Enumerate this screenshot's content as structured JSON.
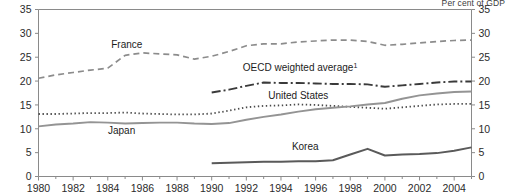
{
  "unit_note": "Per cent of GDP",
  "chart_data": {
    "type": "line",
    "title": "",
    "subtitle": "",
    "xlabel": "",
    "ylabel": "Per cent of GDP",
    "xlim": [
      1980,
      2005
    ],
    "ylim": [
      0,
      35
    ],
    "grid": false,
    "legend_position": "inline-annotations",
    "xticks": [
      1980,
      1982,
      1984,
      1986,
      1988,
      1990,
      1992,
      1994,
      1996,
      1998,
      2000,
      2002,
      2004
    ],
    "xtick_labels": [
      "1980",
      "1982",
      "1984",
      "1986",
      "1988",
      "1990",
      "1992",
      "1994",
      "1996",
      "1998",
      "2000",
      "2002",
      "2004"
    ],
    "yticks": [
      0,
      5,
      10,
      15,
      20,
      25,
      30,
      35
    ],
    "ytick_labels_left": [
      "0",
      "5",
      "10",
      "15",
      "20",
      "25",
      "30",
      "35"
    ],
    "ytick_labels_right": [
      "0",
      "5",
      "10",
      "15",
      "20",
      "25",
      "30",
      "35"
    ],
    "minor_xticks_per_interval": 1,
    "series": [
      {
        "name": "France",
        "label": "France",
        "style": "dashed",
        "color": "#8c8c8c",
        "width": 1.7,
        "dash": "6,4",
        "label_x": 1985.1,
        "label_y": 26.9,
        "x": [
          1980,
          1981,
          1982,
          1983,
          1984,
          1985,
          1986,
          1987,
          1988,
          1989,
          1990,
          1991,
          1992,
          1993,
          1994,
          1995,
          1996,
          1997,
          1998,
          1999,
          2000,
          2001,
          2002,
          2003,
          2004,
          2005
        ],
        "values": [
          20.6,
          21.3,
          21.8,
          22.3,
          22.7,
          25.4,
          25.9,
          25.7,
          25.5,
          24.6,
          25.2,
          26.2,
          27.4,
          27.8,
          27.8,
          28.2,
          28.4,
          28.6,
          28.6,
          28.3,
          27.5,
          27.7,
          28.0,
          28.3,
          28.5,
          28.6
        ]
      },
      {
        "name": "OECD weighted average",
        "label": "OECD weighted average",
        "label_superscript": "1",
        "style": "dash-dot",
        "color": "#3a3a3a",
        "width": 1.9,
        "dash": "9,3,2,3",
        "label_x": 1995.1,
        "label_y": 22.1,
        "x": [
          1990,
          1991,
          1992,
          1993,
          1994,
          1995,
          1996,
          1997,
          1998,
          1999,
          2000,
          2001,
          2002,
          2003,
          2004,
          2005
        ],
        "values": [
          17.6,
          18.2,
          19.0,
          19.7,
          19.6,
          19.6,
          19.5,
          19.4,
          19.4,
          19.3,
          18.8,
          19.1,
          19.4,
          19.7,
          19.9,
          19.9
        ]
      },
      {
        "name": "United States",
        "label": "United States",
        "style": "dotted",
        "color": "#4a4a4a",
        "width": 1.8,
        "dash": "1.4,2.6",
        "label_x": 1995.0,
        "label_y": 16.3,
        "x": [
          1980,
          1981,
          1982,
          1983,
          1984,
          1985,
          1986,
          1987,
          1988,
          1989,
          1990,
          1991,
          1992,
          1993,
          1994,
          1995,
          1996,
          1997,
          1998,
          1999,
          2000,
          2001,
          2002,
          2003,
          2004,
          2005
        ],
        "values": [
          13.1,
          13.1,
          13.2,
          13.3,
          13.3,
          13.4,
          13.2,
          13.1,
          13.0,
          13.0,
          13.2,
          13.8,
          14.5,
          14.8,
          14.9,
          15.1,
          15.0,
          14.8,
          14.6,
          14.4,
          14.2,
          14.5,
          14.8,
          15.1,
          15.2,
          15.2
        ]
      },
      {
        "name": "Japan",
        "label": "Japan",
        "style": "solid",
        "color": "#949494",
        "width": 1.9,
        "dash": "none",
        "label_x": 1984.8,
        "label_y": 9.0,
        "x": [
          1980,
          1981,
          1982,
          1983,
          1984,
          1985,
          1986,
          1987,
          1988,
          1989,
          1990,
          1991,
          1992,
          1993,
          1994,
          1995,
          1996,
          1997,
          1998,
          1999,
          2000,
          2001,
          2002,
          2003,
          2004,
          2005
        ],
        "values": [
          10.5,
          10.9,
          11.1,
          11.4,
          11.3,
          11.1,
          11.2,
          11.3,
          11.3,
          11.1,
          11.0,
          11.2,
          11.9,
          12.5,
          13.0,
          13.6,
          14.1,
          14.4,
          14.7,
          15.1,
          15.4,
          16.3,
          17.0,
          17.4,
          17.7,
          17.8
        ]
      },
      {
        "name": "Korea",
        "label": "Korea",
        "style": "solid",
        "color": "#5a5a5a",
        "width": 2.0,
        "dash": "none",
        "label_x": 1995.4,
        "label_y": 5.6,
        "x": [
          1990,
          1991,
          1992,
          1993,
          1994,
          1995,
          1996,
          1997,
          1998,
          1999,
          2000,
          2001,
          2002,
          2003,
          2004,
          2005
        ],
        "values": [
          2.8,
          2.9,
          3.0,
          3.1,
          3.1,
          3.2,
          3.2,
          3.4,
          4.6,
          5.8,
          4.4,
          4.6,
          4.7,
          4.9,
          5.4,
          6.1
        ]
      }
    ]
  },
  "footnote_marker": "1"
}
